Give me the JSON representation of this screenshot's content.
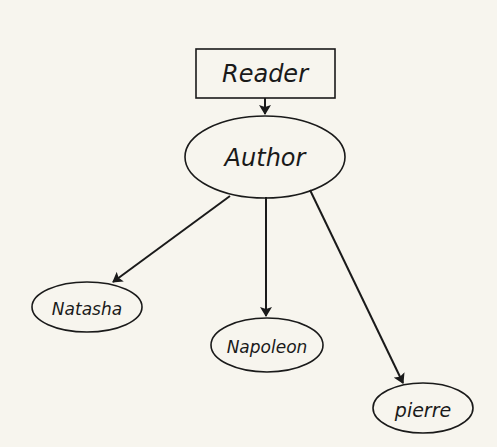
{
  "diagram": {
    "type": "hierarchy",
    "background": "#f7f5ee",
    "ink_color": "#1a1a1a",
    "nodes": [
      {
        "id": "reader",
        "label": "Reader",
        "shape": "rectangle"
      },
      {
        "id": "author",
        "label": "Author",
        "shape": "ellipse"
      },
      {
        "id": "natasha",
        "label": "Natasha",
        "shape": "ellipse"
      },
      {
        "id": "napoleon",
        "label": "Napoleon",
        "shape": "ellipse"
      },
      {
        "id": "pierre",
        "label": "pierre",
        "shape": "ellipse"
      }
    ],
    "edges": [
      {
        "from": "reader",
        "to": "author",
        "directed": true
      },
      {
        "from": "author",
        "to": "natasha",
        "directed": true
      },
      {
        "from": "author",
        "to": "napoleon",
        "directed": true
      },
      {
        "from": "author",
        "to": "pierre",
        "directed": true
      }
    ]
  }
}
